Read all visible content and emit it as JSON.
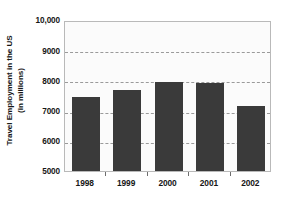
{
  "chart_data": {
    "type": "bar",
    "title": "",
    "subtitle": "",
    "xlabel": "",
    "ylabel": "Travel Employment in the US (in millions)",
    "ylabel_lines": [
      "Travel Employment in the US",
      "(in millions)"
    ],
    "categories": [
      "1998",
      "1999",
      "2000",
      "2001",
      "2002"
    ],
    "values": [
      7450,
      7680,
      7940,
      7920,
      7150
    ],
    "series": [
      {
        "name": "Travel Employment in the US",
        "values": [
          7450,
          7680,
          7940,
          7920,
          7150
        ]
      }
    ],
    "ylim": [
      5000,
      10000
    ],
    "yticks": [
      5000,
      6000,
      7000,
      8000,
      9000,
      10000
    ],
    "ytick_labels": [
      "5000",
      "6000",
      "7000",
      "8000",
      "9000",
      "10,000"
    ],
    "gridlines": [
      6000,
      7000,
      8000,
      9000
    ],
    "grid": true,
    "grid_style": "dashed",
    "legend": false,
    "legend_position": "none",
    "annotations": [],
    "colors": {
      "bar": "#3a3a3a",
      "plot_background": "#fbfbfb",
      "figure_background": "#ffffff",
      "gridline": "#9a9a9a",
      "axis_frame": "#b9b9b9",
      "text": "#161616"
    }
  }
}
